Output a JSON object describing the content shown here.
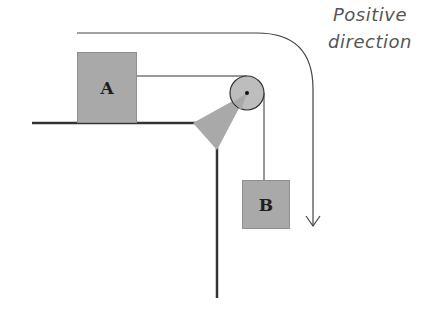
{
  "diagram": {
    "block_a": {
      "label": "A"
    },
    "block_b": {
      "label": "B"
    },
    "direction_label": {
      "line1": "Positive",
      "line2": "direction"
    },
    "colors": {
      "block_fill": "#a9a9a9",
      "pulley_fill": "#bdbdbd",
      "line": "#333333",
      "text": "#555555"
    }
  }
}
